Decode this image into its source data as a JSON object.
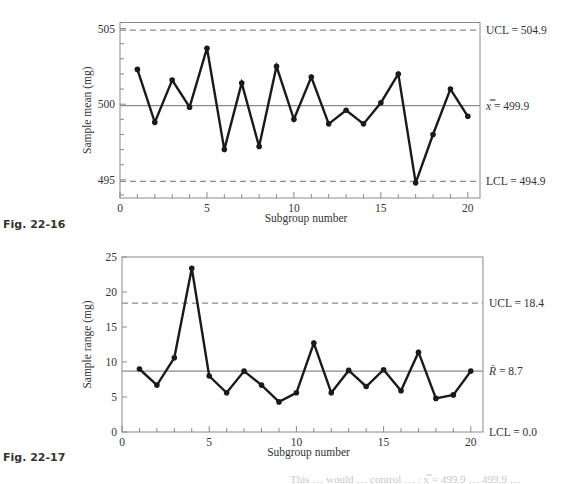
{
  "chart_data": [
    {
      "id": "xbar",
      "type": "line",
      "figure_label": "Fig. 22-16",
      "title": "",
      "xlabel": "Subgroup number",
      "ylabel": "Sample mean (mg)",
      "xlim": [
        0,
        20.7
      ],
      "ylim": [
        493.8,
        505.4
      ],
      "x_ticks": [
        0,
        5,
        10,
        15,
        20
      ],
      "y_ticks": [
        495,
        500,
        505
      ],
      "y_minor_step": 1,
      "x_minor_step": 1,
      "grid": false,
      "x": [
        1,
        2,
        3,
        4,
        5,
        6,
        7,
        8,
        9,
        10,
        11,
        12,
        13,
        14,
        15,
        16,
        17,
        18,
        19,
        20
      ],
      "values": [
        502.3,
        498.8,
        501.6,
        499.8,
        503.7,
        497.0,
        501.4,
        497.2,
        502.5,
        499.0,
        501.8,
        498.7,
        499.6,
        498.7,
        500.1,
        502.0,
        494.8,
        498.0,
        501.0,
        499.2
      ],
      "center_line": {
        "value": 499.9,
        "label_symbol": "x̿",
        "label": "= 499.9"
      },
      "ucl": {
        "value": 504.9,
        "label": "UCL = 504.9"
      },
      "lcl": {
        "value": 494.9,
        "label": "LCL = 494.9"
      }
    },
    {
      "id": "range",
      "type": "line",
      "figure_label": "Fig. 22-17",
      "title": "",
      "xlabel": "Subgroup number",
      "ylabel": "Sample range (mg)",
      "xlim": [
        0,
        20.7
      ],
      "ylim": [
        0,
        25
      ],
      "x_ticks": [
        0,
        5,
        10,
        15,
        20
      ],
      "y_ticks": [
        0,
        5,
        10,
        15,
        20,
        25
      ],
      "y_minor_step": null,
      "x_minor_step": 1,
      "grid": false,
      "x": [
        1,
        2,
        3,
        4,
        5,
        6,
        7,
        8,
        9,
        10,
        11,
        12,
        13,
        14,
        15,
        16,
        17,
        18,
        19,
        20
      ],
      "values": [
        9.0,
        6.7,
        10.6,
        23.4,
        8.0,
        5.6,
        8.7,
        6.7,
        4.3,
        5.6,
        12.7,
        5.6,
        8.8,
        6.5,
        8.9,
        5.9,
        11.4,
        4.8,
        5.3,
        8.7
      ],
      "center_line": {
        "value": 8.7,
        "label_symbol": "R̄",
        "label": "= 8.7"
      },
      "ucl": {
        "value": 18.4,
        "label": "UCL = 18.4"
      },
      "lcl": {
        "value": 0.0,
        "label": "LCL = 0.0"
      }
    }
  ],
  "layout": {
    "plots": [
      {
        "left": 120,
        "right": 480,
        "top": 22.5,
        "bottom": 198,
        "fig_label_y": 228,
        "xlabel_y": 222,
        "ylabel_x": 91
      },
      {
        "left": 122,
        "right": 483,
        "top": 257,
        "bottom": 432,
        "fig_label_y": 461,
        "xlabel_y": 456,
        "ylabel_x": 91
      }
    ]
  },
  "footer": {
    "partial_text": "This … would … control … : x̿ = 499.9 … 499.9 …"
  }
}
